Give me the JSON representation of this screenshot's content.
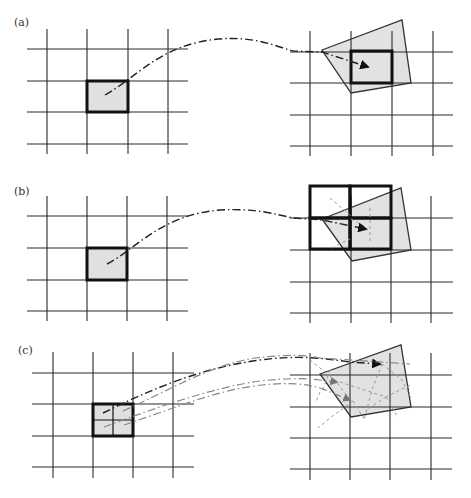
{
  "figure": {
    "colors": {
      "grid_line": "#2a2a2a",
      "bold_line": "#111111",
      "cell_fill": "#e0e0e0",
      "quad_fill": "#e2e2e2",
      "quad_stroke": "#333333",
      "curve_dark": "#222222",
      "curve_light": "#888888"
    },
    "panels": [
      {
        "id": "a",
        "label": "(a)",
        "label_pos": [
          14,
          24
        ],
        "left_grid": {
          "xs": [
            47,
            87,
            128,
            168
          ],
          "ys": [
            49,
            81,
            112,
            144
          ],
          "x_range": [
            27,
            188
          ],
          "y_range": [
            29,
            154
          ]
        },
        "left_cell": {
          "x": 87,
          "y": 81,
          "w": 41,
          "h": 31,
          "subdivided": false
        },
        "right_grid": {
          "xs": [
            310,
            351,
            392,
            433
          ],
          "ys": [
            52,
            83,
            115,
            146
          ],
          "x_range": [
            290,
            453
          ],
          "y_range": [
            31,
            156
          ]
        },
        "quad": [
          [
            322,
            50
          ],
          [
            402,
            20
          ],
          [
            411,
            83
          ],
          [
            351,
            93
          ]
        ],
        "right_bold_cells": [
          {
            "x": 351,
            "y": 51,
            "w": 41,
            "h": 32
          }
        ],
        "curves": [
          {
            "d": "M105,95 C140,75 160,45 218,39 C255,36 275,46 293,51 L322,52 L368,67",
            "tone": "dark",
            "arrow_at": [
              371,
              68
            ]
          }
        ],
        "extra_dashes": []
      },
      {
        "id": "b",
        "label": "(b)",
        "label_pos": [
          14,
          193
        ],
        "left_grid": {
          "xs": [
            47,
            87,
            127,
            167
          ],
          "ys": [
            216,
            248,
            280,
            311
          ],
          "x_range": [
            27,
            188
          ],
          "y_range": [
            196,
            321
          ]
        },
        "left_cell": {
          "x": 87,
          "y": 248,
          "w": 40,
          "h": 32,
          "subdivided": false
        },
        "right_grid": {
          "xs": [
            310,
            351,
            391,
            431
          ],
          "ys": [
            218,
            250,
            282,
            313
          ],
          "x_range": [
            290,
            453
          ],
          "y_range": [
            196,
            323
          ]
        },
        "quad": [
          [
            322,
            219
          ],
          [
            401,
            188
          ],
          [
            411,
            250
          ],
          [
            352,
            261
          ]
        ],
        "right_bold_cells": [
          {
            "x": 310,
            "y": 186,
            "w": 40,
            "h": 32
          },
          {
            "x": 350,
            "y": 186,
            "w": 41,
            "h": 32
          },
          {
            "x": 310,
            "y": 218,
            "w": 40,
            "h": 31
          },
          {
            "x": 350,
            "y": 218,
            "w": 41,
            "h": 31
          }
        ],
        "curves": [
          {
            "d": "M107,264 C135,250 160,215 220,210 C255,208 275,214 293,218 L322,220 L366,229",
            "tone": "dark",
            "arrow_at": [
              370,
              230
            ]
          }
        ],
        "extra_dashes": [
          "M330,198 L351,216",
          "M370,208 L370,242",
          "M332,248 L350,239",
          "M351,219 L364,226"
        ]
      },
      {
        "id": "c",
        "label": "(c)",
        "label_pos": [
          18,
          352
        ],
        "left_grid": {
          "xs": [
            53,
            93,
            133,
            173
          ],
          "ys": [
            373,
            404,
            436,
            467
          ],
          "x_range": [
            32,
            194
          ],
          "y_range": [
            352,
            478
          ]
        },
        "left_cell": {
          "x": 93,
          "y": 404,
          "w": 40,
          "h": 32,
          "subdivided": true
        },
        "right_grid": {
          "xs": [
            310,
            350,
            390,
            431
          ],
          "ys": [
            375,
            407,
            438,
            469
          ],
          "x_range": [
            290,
            452
          ],
          "y_range": [
            353,
            480
          ]
        },
        "quad": [
          [
            320,
            374
          ],
          [
            401,
            345
          ],
          [
            411,
            407
          ],
          [
            351,
            417
          ]
        ],
        "right_bold_cells": [],
        "curves": [
          {
            "d": "M103,413 C150,390 200,368 260,360 C300,355 320,358 350,362 L380,364",
            "tone": "dark",
            "arrow_at": [
              382,
              364
            ]
          },
          {
            "d": "M123,411 C170,390 210,365 255,358 C290,354 305,355 320,358 L410,364",
            "tone": "light",
            "arrow_at": null
          },
          {
            "d": "M104,427 C150,410 210,388 260,381 C290,378 305,378 320,380 L337,382",
            "tone": "light",
            "arrow_at": [
              340,
              382
            ]
          },
          {
            "d": "M124,425 C170,410 215,390 262,385 C290,382 305,384 320,388 L350,400",
            "tone": "light",
            "arrow_at": [
              353,
              401
            ]
          }
        ],
        "extra_dashes": [
          "M330,370 L322,392 M320,392 L316,402",
          "M340,382 L386,397 L412,384",
          "M382,364 L372,390 L364,420",
          "M382,364 L402,380 L411,398",
          "M353,401 L330,418 L318,428",
          "M353,401 L365,420",
          "M386,397 L398,418",
          "M310,360 L335,380 L350,400",
          "M386,397 L366,410"
        ]
      }
    ],
    "caption_fragment": ""
  }
}
